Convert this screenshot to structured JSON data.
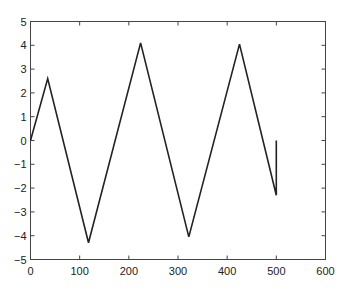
{
  "chart_data": {
    "type": "line",
    "title": "",
    "xlabel": "",
    "ylabel": "",
    "xlim": [
      0,
      600
    ],
    "ylim": [
      -5,
      5
    ],
    "grid": false,
    "legend": null,
    "x_ticks": [
      0,
      100,
      200,
      300,
      400,
      500,
      600
    ],
    "y_ticks": [
      -5,
      -4,
      -3,
      -2,
      -1,
      0,
      1,
      2,
      3,
      4,
      5
    ],
    "x_tick_labels": [
      "0",
      "100",
      "200",
      "300",
      "400",
      "500",
      "600"
    ],
    "y_tick_labels": [
      "−5",
      "−4",
      "−3",
      "−2",
      "−1",
      "0",
      "1",
      "2",
      "3",
      "4",
      "5"
    ],
    "series": [
      {
        "name": "signal",
        "color": "#222222",
        "x": [
          0,
          35,
          118,
          224,
          322,
          425,
          500,
          500
        ],
        "y": [
          0,
          2.6,
          -4.3,
          4.1,
          -4.05,
          4.05,
          -2.3,
          0
        ]
      }
    ]
  }
}
